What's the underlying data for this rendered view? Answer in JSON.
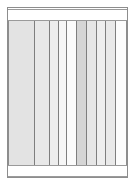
{
  "drawing": {
    "type": "elevation",
    "title": "Paneled Slat Elevation",
    "canvas": {
      "width": 135,
      "height": 185,
      "background": "#ffffff"
    },
    "frame": {
      "x": 7,
      "y": 7,
      "width": 121,
      "height": 171,
      "stroke": "#8d8d8d",
      "stroke_width": 1,
      "fill": "#ffffff"
    },
    "rails": [
      {
        "name": "top-rail",
        "x": 8,
        "y": 9,
        "width": 119,
        "height": 12,
        "fill": "#ffffff",
        "stroke": "#9a9a9a"
      },
      {
        "name": "bottom-rail",
        "x": 8,
        "y": 165,
        "width": 119,
        "height": 12,
        "fill": "#ffffff",
        "stroke": "#9a9a9a"
      }
    ],
    "panel_block": {
      "name": "slat-field",
      "x": 8,
      "y": 21,
      "width": 119,
      "height": 144,
      "stroke": "#8d8d8d",
      "slats": [
        {
          "name": "slat-1",
          "x": 0,
          "width": 25,
          "fill": "#e3e3e3"
        },
        {
          "name": "slat-2",
          "x": 25,
          "width": 15,
          "fill": "#e8e8e8"
        },
        {
          "name": "slat-3",
          "x": 40,
          "width": 9,
          "fill": "#ededed"
        },
        {
          "name": "slat-4",
          "x": 49,
          "width": 8,
          "fill": "#f6f6f6"
        },
        {
          "name": "slat-5",
          "x": 57,
          "width": 10,
          "fill": "#fbfbfb"
        },
        {
          "name": "slat-6",
          "x": 67,
          "width": 10,
          "fill": "#d5d5d5"
        },
        {
          "name": "slat-7",
          "x": 77,
          "width": 10,
          "fill": "#e6e6e6"
        },
        {
          "name": "slat-8",
          "x": 87,
          "width": 9,
          "fill": "#eeeeee"
        },
        {
          "name": "slat-9",
          "x": 96,
          "width": 10,
          "fill": "#e9e9e9"
        },
        {
          "name": "slat-10",
          "x": 106,
          "width": 13,
          "fill": "#fcfcfc"
        }
      ],
      "divider_color": "#7e7e7e",
      "divider_positions": [
        25,
        40,
        49,
        57,
        67,
        77,
        87,
        96,
        106
      ]
    },
    "colors": {
      "outline": "#8d8d8d",
      "hairline": "#7e7e7e",
      "paper": "#ffffff",
      "shade_light": "#fcfcfc",
      "shade_mid": "#e6e6e6",
      "shade_dark": "#d5d5d5"
    }
  }
}
